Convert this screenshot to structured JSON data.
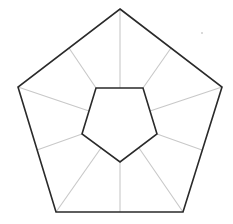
{
  "diagram": {
    "title": "",
    "colors": {
      "background": "#ffffff",
      "outline": "#2a2a2a",
      "spoke": "#c8c8c8",
      "dot": "#9a9a9a"
    },
    "outer_pentagon": [
      [
        120,
        9
      ],
      [
        222,
        87
      ],
      [
        183,
        212
      ],
      [
        56,
        212
      ],
      [
        18,
        87
      ]
    ],
    "inner_pentagon": [
      [
        96,
        88
      ],
      [
        143,
        88
      ],
      [
        157,
        134
      ],
      [
        120,
        162
      ],
      [
        82,
        134
      ]
    ],
    "spokes": [
      [
        [
          120,
          9
        ],
        [
          120,
          88
        ]
      ],
      [
        [
          171,
          48
        ],
        [
          143,
          88
        ]
      ],
      [
        [
          222,
          87
        ],
        [
          150,
          111
        ]
      ],
      [
        [
          202,
          150
        ],
        [
          157,
          134
        ]
      ],
      [
        [
          183,
          212
        ],
        [
          139,
          148
        ]
      ],
      [
        [
          120,
          212
        ],
        [
          120,
          162
        ]
      ],
      [
        [
          56,
          212
        ],
        [
          101,
          148
        ]
      ],
      [
        [
          37,
          150
        ],
        [
          82,
          134
        ]
      ],
      [
        [
          18,
          87
        ],
        [
          89,
          111
        ]
      ],
      [
        [
          69,
          48
        ],
        [
          96,
          88
        ]
      ]
    ],
    "stray_dot": [
      202,
      33
    ]
  }
}
